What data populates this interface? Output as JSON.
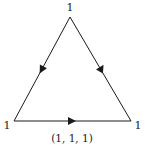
{
  "diagram": {
    "type": "directed-triangle-cycle",
    "vertices": [
      {
        "id": "top",
        "label": "1",
        "x": 70,
        "y": 17
      },
      {
        "id": "bottom-left",
        "label": "1",
        "x": 14,
        "y": 121
      },
      {
        "id": "bottom-right",
        "label": "1",
        "x": 131,
        "y": 121
      }
    ],
    "edges": [
      {
        "from": "bottom-left",
        "to": "bottom-right",
        "arrow": "right"
      },
      {
        "from": "bottom-right",
        "to": "top",
        "arrow": "up"
      },
      {
        "from": "top",
        "to": "bottom-left",
        "arrow": "down"
      }
    ],
    "caption": "(1, 1, 1)",
    "colors": {
      "stroke": "#1a1a1a",
      "background": "#ffffff"
    }
  }
}
